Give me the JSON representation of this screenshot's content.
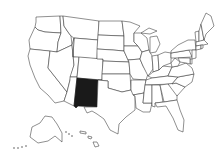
{
  "map": {
    "subject": "United States of America",
    "style": "black-and-white state outline map",
    "highlighted_state": "New Mexico",
    "highlight_color": "#1a1a1a",
    "base_fill": "#ffffff",
    "border_color": "#333333",
    "states": [
      "Washington",
      "Oregon",
      "California",
      "Idaho",
      "Nevada",
      "Montana",
      "Wyoming",
      "Utah",
      "Arizona",
      "Colorado",
      "New Mexico",
      "North Dakota",
      "South Dakota",
      "Nebraska",
      "Kansas",
      "Oklahoma",
      "Texas",
      "Minnesota",
      "Iowa",
      "Missouri",
      "Arkansas",
      "Louisiana",
      "Wisconsin",
      "Illinois",
      "Michigan",
      "Indiana",
      "Kentucky",
      "Tennessee",
      "Mississippi",
      "Alabama",
      "Ohio",
      "Georgia",
      "Florida",
      "South Carolina",
      "North Carolina",
      "Virginia",
      "West Virginia",
      "Pennsylvania",
      "New York",
      "Vermont",
      "New Hampshire",
      "Maine",
      "Massachusetts",
      "Connecticut",
      "Rhode Island",
      "New Jersey",
      "Delaware",
      "Maryland",
      "Alaska",
      "Hawaii"
    ]
  }
}
